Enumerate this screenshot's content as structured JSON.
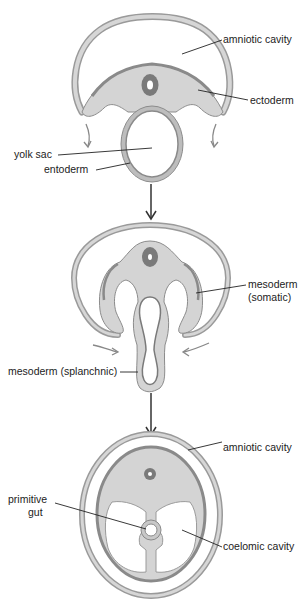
{
  "colors": {
    "membrane": "#bdbdbd",
    "membrane_edge": "#8c8c8c",
    "tissue": "#d4d4d4",
    "dark_layer": "#8a8a8a",
    "neural_tube": "#7a7a7a",
    "leader": "#222222",
    "arrow": "#333333",
    "curved_arrow": "#888888"
  },
  "stage1": {
    "labels": {
      "amniotic_cavity": "amniotic cavity",
      "ectoderm": "ectoderm",
      "yolk_sac": "yolk sac",
      "entoderm": "entoderm"
    }
  },
  "stage2": {
    "labels": {
      "mesoderm_somatic_1": "mesoderm",
      "mesoderm_somatic_2": "(somatic)",
      "mesoderm_splanchnic": "mesoderm (splanchnic)"
    }
  },
  "stage3": {
    "labels": {
      "amniotic_cavity": "amniotic cavity",
      "primitive_gut_1": "primitive",
      "primitive_gut_2": "gut",
      "coelomic_cavity": "coelomic cavity"
    }
  }
}
